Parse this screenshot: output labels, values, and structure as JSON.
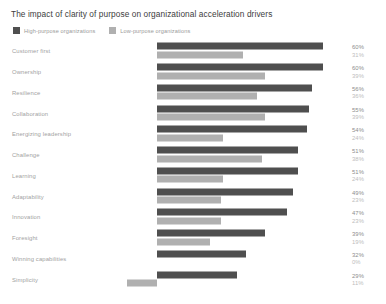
{
  "chart_data": {
    "type": "bar",
    "title": "The impact of clarity of purpose on organizational acceleration drivers",
    "orientation": "horizontal",
    "grouping": "grouped",
    "xlabel": "",
    "ylabel": "",
    "xlim": [
      0,
      65
    ],
    "grid": false,
    "legend_position": "top-left",
    "value_suffix": "%",
    "categories": [
      "Customer first",
      "Ownership",
      "Resilience",
      "Collaboration",
      "Energizing leadership",
      "Challenge",
      "Learning",
      "Adaptability",
      "Innovation",
      "Foresight",
      "Winning capabilities",
      "Simplicity"
    ],
    "series": [
      {
        "name": "High-purpose organizations",
        "color": "#4f4f4f",
        "values": [
          60,
          60,
          56,
          55,
          54,
          51,
          51,
          49,
          47,
          39,
          32,
          29
        ]
      },
      {
        "name": "Low-purpose organizations",
        "color": "#b0b0b0",
        "values": [
          31,
          39,
          36,
          39,
          24,
          38,
          24,
          23,
          23,
          19,
          0,
          11
        ]
      }
    ],
    "value_labels": [
      {
        "high": "60%",
        "low": "31%"
      },
      {
        "high": "60%",
        "low": "39%"
      },
      {
        "high": "56%",
        "low": "36%"
      },
      {
        "high": "55%",
        "low": "39%"
      },
      {
        "high": "54%",
        "low": "24%"
      },
      {
        "high": "51%",
        "low": "38%"
      },
      {
        "high": "51%",
        "low": "24%"
      },
      {
        "high": "49%",
        "low": "23%"
      },
      {
        "high": "47%",
        "low": "23%"
      },
      {
        "high": "39%",
        "low": "19%"
      },
      {
        "high": "32%",
        "low": "0%"
      },
      {
        "high": "29%",
        "low": "11%"
      }
    ]
  },
  "legend": {
    "items": [
      {
        "label": "High-purpose organizations",
        "color": "#4f4f4f"
      },
      {
        "label": "Low-purpose organizations",
        "color": "#b0b0b0"
      }
    ]
  },
  "colors": {
    "high_purpose": "#4f4f4f",
    "low_purpose": "#b0b0b0",
    "title_text": "#3d3d3d",
    "label_text": "#a2a2a2",
    "background": "#ffffff"
  }
}
